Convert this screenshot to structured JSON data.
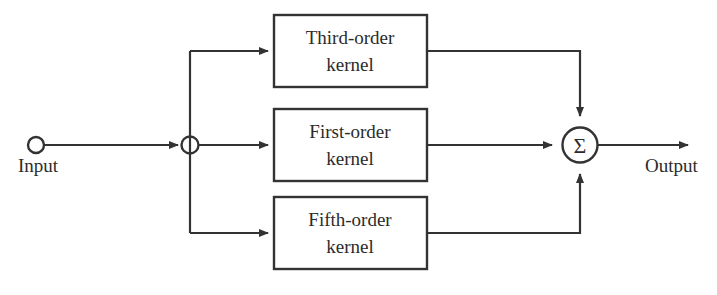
{
  "diagram": {
    "input_port": {
      "label": "Input",
      "icon": "open-circle-terminal"
    },
    "output_port": {
      "label": "Output",
      "icon": "arrow-right"
    },
    "branch_node": {
      "name": "branch-junction",
      "icon": "open-circle-node"
    },
    "summation_node": {
      "symbol": "Σ",
      "name": "summation-node"
    },
    "blocks": [
      {
        "id": "third-order-kernel",
        "line1": "Third-order",
        "line2": "kernel"
      },
      {
        "id": "first-order-kernel",
        "line1": "First-order",
        "line2": "kernel"
      },
      {
        "id": "fifth-order-kernel",
        "line1": "Fifth-order",
        "line2": "kernel"
      }
    ],
    "colors": {
      "stroke": "#333333",
      "text": "#2b2b2b",
      "background": "#ffffff"
    }
  }
}
